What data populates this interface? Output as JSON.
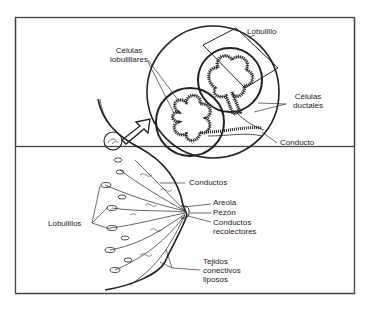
{
  "diagram": {
    "type": "anatomical-illustration",
    "labels": {
      "lobulillo": "Lobulillo",
      "celulas_lobulillares_1": "Células",
      "celulas_lobulillares_2": "lobulillares",
      "celulas_ductales_1": "Células",
      "celulas_ductales_2": "ductales",
      "conducto": "Conducto",
      "conductos": "Conductos",
      "areola": "Areola",
      "pezon": "Pezón",
      "conductos_recolectores_1": "Conductos",
      "conductos_recolectores_2": "recolectores",
      "lobulillos": "Lobulillos",
      "tejidos_1": "Tejidos",
      "tejidos_2": "conectivos",
      "tejidos_3": "liposos"
    },
    "colors": {
      "line": "#222222",
      "border": "#444444",
      "background": "#ffffff"
    }
  }
}
